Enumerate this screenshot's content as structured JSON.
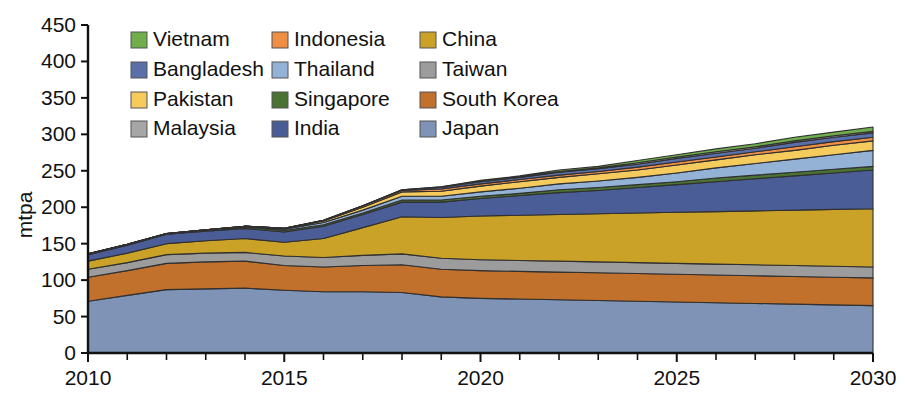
{
  "chart_data": {
    "type": "area",
    "stacked": true,
    "title": "",
    "xlabel": "",
    "ylabel": "mtpa",
    "xlim": [
      2010,
      2030
    ],
    "ylim": [
      0,
      450
    ],
    "yticks": [
      0,
      50,
      100,
      150,
      200,
      250,
      300,
      350,
      400,
      450
    ],
    "xticks_major": [
      2010,
      2015,
      2020,
      2025,
      2030
    ],
    "xticks_minor_step": 1,
    "grid": false,
    "legend_position": "top-center-inside",
    "x": [
      2010,
      2011,
      2012,
      2013,
      2014,
      2015,
      2016,
      2017,
      2018,
      2019,
      2020,
      2021,
      2022,
      2023,
      2024,
      2025,
      2026,
      2027,
      2028,
      2029,
      2030
    ],
    "stack_order_bottom_to_top": [
      "Japan",
      "South Korea",
      "Taiwan",
      "China",
      "India",
      "Singapore",
      "Thailand",
      "Pakistan",
      "Indonesia",
      "Bangladesh",
      "Malaysia",
      "Vietnam"
    ],
    "series": [
      {
        "name": "Japan",
        "color": "#7e93b5",
        "values": [
          71,
          79,
          87,
          88,
          89,
          86,
          84,
          84,
          83,
          77,
          75,
          74,
          73,
          72,
          71,
          70,
          69,
          68,
          67,
          66,
          65
        ]
      },
      {
        "name": "South Korea",
        "color": "#c1712b",
        "values": [
          33,
          34,
          36,
          37,
          37,
          34,
          34,
          36,
          38,
          38,
          38,
          38,
          38,
          38,
          38,
          38,
          38,
          38,
          38,
          38,
          38
        ]
      },
      {
        "name": "Taiwan",
        "color": "#9c9c9c",
        "values": [
          11,
          11,
          12,
          12,
          12,
          13,
          13,
          14,
          15,
          15,
          15,
          15,
          15,
          15,
          15,
          15,
          15,
          15,
          15,
          15,
          15
        ]
      },
      {
        "name": "China",
        "color": "#c9a227",
        "values": [
          11,
          13,
          15,
          17,
          19,
          19,
          26,
          38,
          51,
          56,
          60,
          62,
          64,
          66,
          68,
          70,
          72,
          74,
          76,
          78,
          80
        ]
      },
      {
        "name": "India",
        "color": "#4b5d96",
        "values": [
          9,
          11,
          13,
          13,
          14,
          14,
          17,
          18,
          20,
          21,
          24,
          27,
          30,
          32,
          35,
          38,
          41,
          44,
          47,
          50,
          53
        ]
      },
      {
        "name": "Singapore",
        "color": "#4a7233",
        "values": [
          0,
          0,
          0,
          1,
          2,
          2,
          2,
          2,
          3,
          3,
          3,
          3,
          4,
          4,
          4,
          4,
          5,
          5,
          5,
          5,
          5
        ]
      },
      {
        "name": "Thailand",
        "color": "#93b2d6",
        "values": [
          1,
          1,
          1,
          1,
          1,
          2,
          3,
          4,
          5,
          5,
          6,
          7,
          8,
          9,
          10,
          12,
          14,
          16,
          18,
          20,
          22
        ]
      },
      {
        "name": "Pakistan",
        "color": "#f4cb5c",
        "values": [
          0,
          0,
          0,
          0,
          0,
          1,
          2,
          4,
          6,
          7,
          8,
          9,
          9,
          10,
          10,
          11,
          11,
          12,
          12,
          13,
          13
        ]
      },
      {
        "name": "Indonesia",
        "color": "#ef8e45",
        "values": [
          0,
          0,
          0,
          0,
          0,
          0,
          1,
          2,
          2,
          3,
          3,
          3,
          3,
          3,
          4,
          4,
          4,
          4,
          5,
          5,
          5
        ]
      },
      {
        "name": "Bangladesh",
        "color": "#5a6ea8",
        "values": [
          0,
          0,
          0,
          0,
          0,
          0,
          0,
          0,
          1,
          2,
          3,
          3,
          4,
          4,
          4,
          5,
          5,
          5,
          6,
          6,
          6
        ]
      },
      {
        "name": "Malaysia",
        "color": "#a6a6a6",
        "values": [
          0,
          0,
          0,
          0,
          0,
          0,
          0,
          0,
          0,
          1,
          1,
          1,
          1,
          1,
          2,
          2,
          2,
          2,
          2,
          2,
          2
        ]
      },
      {
        "name": "Vietnam",
        "color": "#6fae4b",
        "values": [
          0,
          0,
          0,
          0,
          0,
          0,
          0,
          0,
          0,
          0,
          1,
          1,
          2,
          2,
          3,
          3,
          4,
          4,
          5,
          5,
          6
        ]
      }
    ],
    "totals": [
      136,
      149,
      164,
      169,
      174,
      171,
      182,
      202,
      224,
      228,
      237,
      243,
      251,
      256,
      264,
      272,
      280,
      287,
      296,
      303,
      310
    ]
  },
  "axis": {
    "y_title": "mtpa",
    "y_tick_labels": [
      "0",
      "50",
      "100",
      "150",
      "200",
      "250",
      "300",
      "350",
      "400",
      "450"
    ],
    "x_tick_labels": [
      "2010",
      "2015",
      "2020",
      "2025",
      "2030"
    ]
  },
  "legend": {
    "rows": [
      [
        {
          "label": "Vietnam",
          "color": "#6fae4b"
        },
        {
          "label": "Indonesia",
          "color": "#ef8e45"
        },
        {
          "label": "China",
          "color": "#c9a227"
        }
      ],
      [
        {
          "label": "Bangladesh",
          "color": "#5a6ea8"
        },
        {
          "label": "Thailand",
          "color": "#93b2d6"
        },
        {
          "label": "Taiwan",
          "color": "#9c9c9c"
        }
      ],
      [
        {
          "label": "Pakistan",
          "color": "#f4cb5c"
        },
        {
          "label": "Singapore",
          "color": "#4a7233"
        },
        {
          "label": "South Korea",
          "color": "#c1712b"
        }
      ],
      [
        {
          "label": "Malaysia",
          "color": "#a6a6a6"
        },
        {
          "label": "India",
          "color": "#4b5d96"
        },
        {
          "label": "Japan",
          "color": "#7e93b5"
        }
      ]
    ]
  }
}
